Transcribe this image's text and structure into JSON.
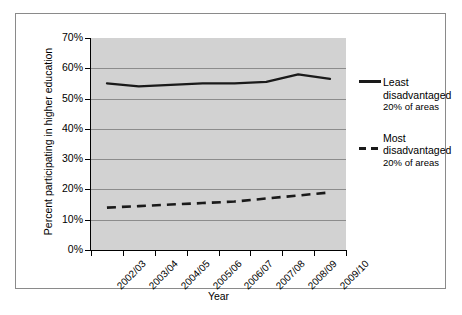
{
  "chart_data": {
    "type": "line",
    "title": "",
    "xlabel": "Year",
    "ylabel": "Percent participating in higher education",
    "categories": [
      "2002/03",
      "2003/04",
      "2004/05",
      "2005/06",
      "2006/07",
      "2007/08",
      "2008/09",
      "2009/10"
    ],
    "ylim": [
      0,
      70
    ],
    "ytick_labels": [
      "70%",
      "60%",
      "50%",
      "40%",
      "30%",
      "20%",
      "10%",
      "0%"
    ],
    "ytick_values": [
      70,
      60,
      50,
      40,
      30,
      20,
      10,
      0
    ],
    "grid": true,
    "legend_position": "right",
    "plot_background": "#d2d2d2",
    "series": [
      {
        "name": "Least disadvantaged 20% of areas",
        "style": "solid",
        "color": "#1a1a1a",
        "values": [
          55,
          54,
          54.5,
          55,
          55,
          55.5,
          58,
          56.5
        ]
      },
      {
        "name": "Most disadvantaged 20% of areas",
        "style": "dashed",
        "color": "#1a1a1a",
        "values": [
          14,
          14.5,
          15,
          15.5,
          16,
          17,
          18,
          19
        ]
      }
    ]
  },
  "legend": {
    "entries": [
      {
        "line1": "Least",
        "line2": "disadvantaged",
        "line3": "20% of areas",
        "style": "solid"
      },
      {
        "line1": "Most",
        "line2": "disadvantaged",
        "line3": "20% of areas",
        "style": "dashed"
      }
    ]
  }
}
